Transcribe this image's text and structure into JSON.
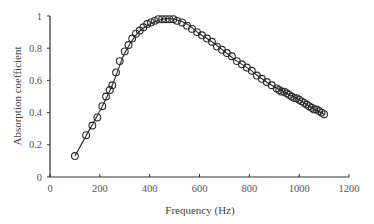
{
  "chart_data": {
    "type": "scatter",
    "title": "",
    "xlabel": "Frequency (Hz)",
    "ylabel": "Absorption coefficient",
    "xlim": [
      0,
      1200
    ],
    "ylim": [
      0,
      1
    ],
    "xticks": [
      0,
      200,
      400,
      600,
      800,
      1000,
      1200
    ],
    "yticks": [
      0,
      0.2,
      0.4,
      0.6,
      0.8,
      1
    ],
    "ytick_labels": [
      "0",
      "0.2",
      "0.4",
      "0.6",
      "0.8",
      "1"
    ],
    "grid": false,
    "legend": null,
    "series": [
      {
        "name": "Measured",
        "style": "open-circle-markers",
        "x": [
          100,
          145,
          170,
          190,
          210,
          225,
          240,
          250,
          265,
          280,
          300,
          315,
          330,
          345,
          360,
          375,
          390,
          405,
          420,
          435,
          450,
          465,
          480,
          495,
          510,
          530,
          550,
          570,
          590,
          610,
          630,
          650,
          670,
          690,
          710,
          730,
          750,
          770,
          790,
          810,
          830,
          850,
          870,
          890,
          910,
          920,
          930,
          940,
          950,
          960,
          970,
          980,
          990,
          1000,
          1010,
          1020,
          1030,
          1040,
          1050,
          1060,
          1070,
          1080,
          1090,
          1100
        ],
        "y": [
          0.13,
          0.26,
          0.32,
          0.37,
          0.44,
          0.5,
          0.54,
          0.57,
          0.65,
          0.72,
          0.78,
          0.82,
          0.86,
          0.89,
          0.91,
          0.93,
          0.95,
          0.96,
          0.97,
          0.98,
          0.98,
          0.98,
          0.98,
          0.98,
          0.97,
          0.96,
          0.94,
          0.92,
          0.9,
          0.88,
          0.86,
          0.84,
          0.81,
          0.79,
          0.77,
          0.75,
          0.72,
          0.7,
          0.68,
          0.66,
          0.63,
          0.61,
          0.59,
          0.57,
          0.55,
          0.54,
          0.53,
          0.53,
          0.52,
          0.51,
          0.5,
          0.49,
          0.49,
          0.48,
          0.47,
          0.46,
          0.45,
          0.44,
          0.43,
          0.42,
          0.42,
          0.41,
          0.4,
          0.39
        ]
      },
      {
        "name": "Fitted",
        "style": "solid-line",
        "x": [
          100,
          150,
          200,
          250,
          300,
          350,
          400,
          450,
          500,
          550,
          600,
          650,
          700,
          750,
          800,
          850,
          900,
          950,
          1000,
          1050,
          1100
        ],
        "y": [
          0.13,
          0.27,
          0.41,
          0.57,
          0.77,
          0.89,
          0.95,
          0.98,
          0.98,
          0.95,
          0.89,
          0.84,
          0.78,
          0.72,
          0.67,
          0.61,
          0.56,
          0.52,
          0.48,
          0.43,
          0.39
        ]
      }
    ]
  }
}
